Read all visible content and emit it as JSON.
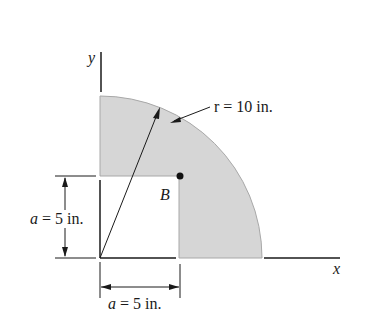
{
  "figure": {
    "axes": {
      "x_label": "x",
      "y_label": "y"
    },
    "radius_label": "r = 10 in.",
    "point_label": "B",
    "dim_vertical": {
      "var": "a",
      "text": " = 5 in."
    },
    "dim_horizontal": {
      "var": "a",
      "text": " = 5 in."
    },
    "colors": {
      "fill": "#d6d6d6",
      "edge": "#9a9a9a",
      "ink": "#1a1a1a"
    },
    "geometry": {
      "radius_in": 10,
      "a_in": 5,
      "shape": "quarter circle with a x a square removed at origin"
    }
  }
}
